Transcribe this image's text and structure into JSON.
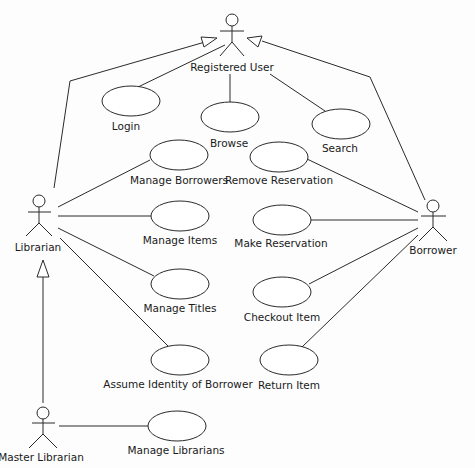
{
  "diagram": {
    "type": "uml-use-case",
    "actors": [
      {
        "id": "registered_user",
        "label": "Registered User"
      },
      {
        "id": "librarian",
        "label": "Librarian"
      },
      {
        "id": "borrower",
        "label": "Borrower"
      },
      {
        "id": "master_librarian",
        "label": "Master Librarian"
      }
    ],
    "use_cases": [
      {
        "id": "login",
        "label": "Login"
      },
      {
        "id": "browse",
        "label": "Browse"
      },
      {
        "id": "search",
        "label": "Search"
      },
      {
        "id": "manage_borrowers",
        "label": "Manage Borrowers"
      },
      {
        "id": "remove_reservation",
        "label": "Remove Reservation"
      },
      {
        "id": "manage_items",
        "label": "Manage Items"
      },
      {
        "id": "make_reservation",
        "label": "Make Reservation"
      },
      {
        "id": "manage_titles",
        "label": "Manage Titles"
      },
      {
        "id": "checkout_item",
        "label": "Checkout Item"
      },
      {
        "id": "assume_identity",
        "label": "Assume Identity of Borrower"
      },
      {
        "id": "return_item",
        "label": "Return Item"
      },
      {
        "id": "manage_librarians",
        "label": "Manage Librarians"
      }
    ],
    "associations": [
      [
        "registered_user",
        "login"
      ],
      [
        "registered_user",
        "browse"
      ],
      [
        "registered_user",
        "search"
      ],
      [
        "librarian",
        "manage_borrowers"
      ],
      [
        "librarian",
        "manage_items"
      ],
      [
        "librarian",
        "manage_titles"
      ],
      [
        "librarian",
        "assume_identity"
      ],
      [
        "borrower",
        "remove_reservation"
      ],
      [
        "borrower",
        "make_reservation"
      ],
      [
        "borrower",
        "checkout_item"
      ],
      [
        "borrower",
        "return_item"
      ],
      [
        "master_librarian",
        "manage_librarians"
      ]
    ],
    "generalizations": [
      {
        "child": "librarian",
        "parent": "registered_user"
      },
      {
        "child": "borrower",
        "parent": "registered_user"
      },
      {
        "child": "master_librarian",
        "parent": "librarian"
      }
    ]
  }
}
